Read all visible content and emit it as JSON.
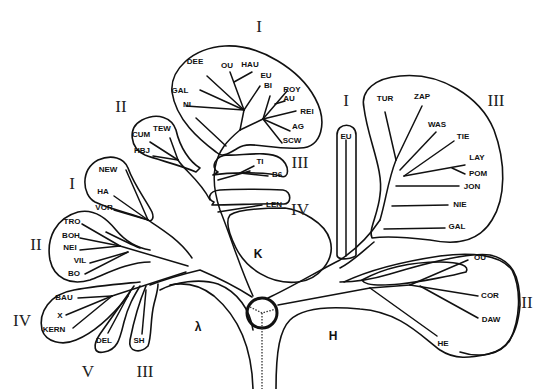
{
  "diagram": {
    "type": "phylogenetic-tree",
    "regions": [
      {
        "label": "K",
        "x": 258,
        "y": 254
      },
      {
        "label": "λ",
        "x": 198,
        "y": 327
      },
      {
        "label": "H",
        "x": 333,
        "y": 336
      }
    ],
    "clade_numerals": [
      {
        "label": "I",
        "x": 259,
        "y": 28,
        "clade": "top"
      },
      {
        "label": "II",
        "x": 118,
        "y": 108,
        "clade": "cum"
      },
      {
        "label": "III",
        "x": 299,
        "y": 164,
        "clade": "ti"
      },
      {
        "label": "IV",
        "x": 299,
        "y": 211,
        "clade": "len"
      },
      {
        "label": "I",
        "x": 72,
        "y": 185,
        "clade": "new"
      },
      {
        "label": "II",
        "x": 36,
        "y": 246,
        "clade": "tro"
      },
      {
        "label": "IV",
        "x": 22,
        "y": 322,
        "clade": "bau"
      },
      {
        "label": "V",
        "x": 88,
        "y": 373,
        "clade": "del"
      },
      {
        "label": "III",
        "x": 145,
        "y": 373,
        "clade": "sh"
      },
      {
        "label": "I",
        "x": 346,
        "y": 102,
        "clade": "eu"
      },
      {
        "label": "III",
        "x": 494,
        "y": 102,
        "clade": "tur"
      },
      {
        "label": "II",
        "x": 527,
        "y": 304,
        "clade": "ou"
      }
    ],
    "leaves": [
      {
        "label": "DEE",
        "x": 195,
        "y": 61
      },
      {
        "label": "OU",
        "x": 221,
        "y": 65
      },
      {
        "label": "HAU",
        "x": 241,
        "y": 64
      },
      {
        "label": "EU",
        "x": 260,
        "y": 75
      },
      {
        "label": "BI",
        "x": 263,
        "y": 85
      },
      {
        "label": "ROY",
        "x": 284,
        "y": 89
      },
      {
        "label": "AU",
        "x": 283,
        "y": 99
      },
      {
        "label": "REI",
        "x": 300,
        "y": 111
      },
      {
        "label": "AG",
        "x": 293,
        "y": 127
      },
      {
        "label": "SCW",
        "x": 283,
        "y": 141
      },
      {
        "label": "GAL",
        "x": 173,
        "y": 91
      },
      {
        "label": "NI",
        "x": 183,
        "y": 105
      },
      {
        "label": "TEW",
        "x": 155,
        "y": 130
      },
      {
        "label": "CUM",
        "x": 133,
        "y": 135
      },
      {
        "label": "HBJ",
        "x": 135,
        "y": 152
      },
      {
        "label": "TI",
        "x": 258,
        "y": 163
      },
      {
        "label": "B6",
        "x": 272,
        "y": 175
      },
      {
        "label": "LEN",
        "x": 266,
        "y": 205
      },
      {
        "label": "NEW",
        "x": 98,
        "y": 171
      },
      {
        "label": "HA",
        "x": 97,
        "y": 193
      },
      {
        "label": "VOR",
        "x": 95,
        "y": 209
      },
      {
        "label": "TRO",
        "x": 65,
        "y": 222
      },
      {
        "label": "BOH",
        "x": 64,
        "y": 236
      },
      {
        "label": "NEI",
        "x": 63,
        "y": 248
      },
      {
        "label": "VIL",
        "x": 73,
        "y": 261
      },
      {
        "label": "BO",
        "x": 68,
        "y": 274
      },
      {
        "label": "BAU",
        "x": 56,
        "y": 298
      },
      {
        "label": "X",
        "x": 58,
        "y": 316
      },
      {
        "label": "KERN",
        "x": 44,
        "y": 331
      },
      {
        "label": "DEL",
        "x": 98,
        "y": 342
      },
      {
        "label": "SH",
        "x": 134,
        "y": 342
      },
      {
        "label": "EU",
        "x": 340,
        "y": 138
      },
      {
        "label": "TUR",
        "x": 377,
        "y": 101
      },
      {
        "label": "ZAP",
        "x": 415,
        "y": 98
      },
      {
        "label": "WAS",
        "x": 429,
        "y": 126
      },
      {
        "label": "TIE",
        "x": 457,
        "y": 139
      },
      {
        "label": "LAY",
        "x": 468,
        "y": 159
      },
      {
        "label": "POM",
        "x": 468,
        "y": 175
      },
      {
        "label": "JON",
        "x": 463,
        "y": 189
      },
      {
        "label": "NIE",
        "x": 452,
        "y": 207
      },
      {
        "label": "GAL",
        "x": 449,
        "y": 230
      },
      {
        "label": "OU",
        "x": 471,
        "y": 260
      },
      {
        "label": "COR",
        "x": 481,
        "y": 298
      },
      {
        "label": "DAW",
        "x": 483,
        "y": 321
      },
      {
        "label": "HE",
        "x": 437,
        "y": 345
      }
    ]
  }
}
